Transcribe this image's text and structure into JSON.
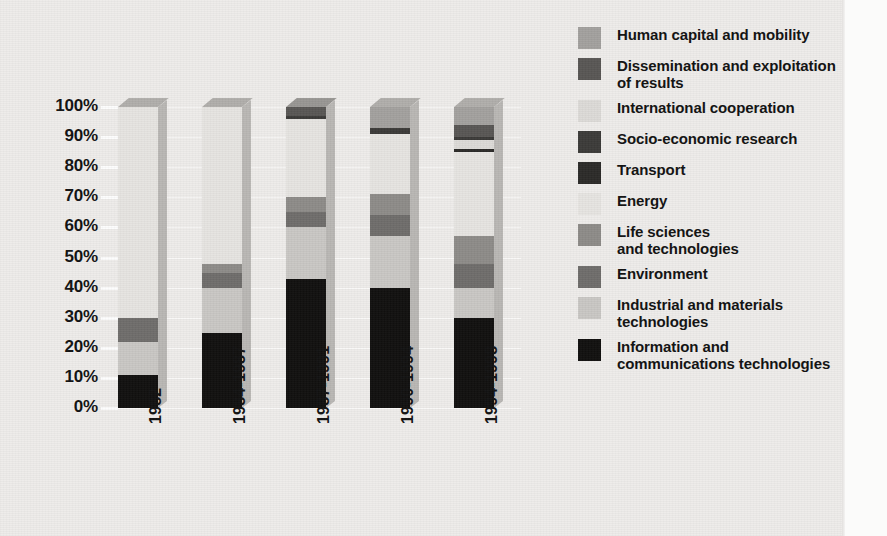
{
  "chart_data": {
    "type": "bar",
    "subtype": "stacked-percentage-column-3d",
    "title": "",
    "subtitle": "",
    "xlabel": "",
    "ylabel": "",
    "categories": [
      "1982",
      "1984-1987",
      "1987-1991",
      "1990-1994",
      "1994-1998"
    ],
    "ylim": [
      0,
      100
    ],
    "ytick_labels": [
      "100%",
      "90%",
      "80%",
      "70%",
      "60%",
      "50%",
      "40%",
      "30%",
      "20%",
      "10%",
      "0%"
    ],
    "ytick_values": [
      100,
      90,
      80,
      70,
      60,
      50,
      40,
      30,
      20,
      10,
      0
    ],
    "grid": true,
    "legend_position": "right",
    "units": "percent of total budget",
    "series": [
      {
        "name": "Information and communications technologies",
        "color": "#100f0e",
        "values": [
          11,
          25,
          43,
          40,
          30
        ]
      },
      {
        "name": "Industrial and materials technologies",
        "color": "#c9c7c4",
        "values": [
          11,
          15,
          17,
          17,
          10
        ]
      },
      {
        "name": "Environment",
        "color": "#6f6d6b",
        "values": [
          8,
          5,
          5,
          7,
          8
        ]
      },
      {
        "name": "Life sciences and technologies",
        "color": "#8d8b88",
        "values": [
          0,
          3,
          5,
          7,
          9
        ]
      },
      {
        "name": "Energy",
        "color": "#e3e1de",
        "values": [
          70,
          52,
          27,
          21,
          28
        ]
      },
      {
        "name": "Transport",
        "color": "#2b2a28",
        "values": [
          0,
          0,
          0,
          0,
          1
        ]
      },
      {
        "name": "Socio-economic research",
        "color": "#3b3a38",
        "values": [
          0,
          0,
          1,
          1,
          1
        ]
      },
      {
        "name": "International cooperation",
        "color": "#dcdad7",
        "values": [
          0,
          0,
          0,
          0,
          3
        ]
      },
      {
        "name": "Dissemination and exploitation of results",
        "color": "#585654",
        "values": [
          0,
          0,
          2,
          0,
          4
        ]
      },
      {
        "name": "Human capital and mobility",
        "color": "#a3a19e",
        "values": [
          0,
          0,
          0,
          7,
          6
        ]
      }
    ],
    "stacks": [
      {
        "category": "1982",
        "segments": [
          {
            "name": "Information and communications technologies",
            "from": 0,
            "to": 11,
            "color": "#100f0e"
          },
          {
            "name": "Industrial and materials technologies",
            "from": 11,
            "to": 22,
            "color": "#c9c7c4"
          },
          {
            "name": "Environment",
            "from": 22,
            "to": 30,
            "color": "#6f6d6b"
          },
          {
            "name": "Energy",
            "from": 30,
            "to": 100,
            "color": "#e6e4e1"
          }
        ],
        "cap_color": "#a3a19e"
      },
      {
        "category": "1984-1987",
        "segments": [
          {
            "name": "Information and communications technologies",
            "from": 0,
            "to": 25,
            "color": "#100f0e"
          },
          {
            "name": "Industrial and materials technologies",
            "from": 25,
            "to": 40,
            "color": "#c9c7c4"
          },
          {
            "name": "Environment",
            "from": 40,
            "to": 45,
            "color": "#6f6d6b"
          },
          {
            "name": "Life sciences and technologies",
            "from": 45,
            "to": 48,
            "color": "#8d8b88"
          },
          {
            "name": "Energy",
            "from": 48,
            "to": 100,
            "color": "#e6e4e1"
          }
        ],
        "cap_color": "#a3a19e"
      },
      {
        "category": "1987-1991",
        "segments": [
          {
            "name": "Information and communications technologies",
            "from": 0,
            "to": 43,
            "color": "#100f0e"
          },
          {
            "name": "Industrial and materials technologies",
            "from": 43,
            "to": 60,
            "color": "#c9c7c4"
          },
          {
            "name": "Environment",
            "from": 60,
            "to": 65,
            "color": "#6f6d6b"
          },
          {
            "name": "Life sciences and technologies",
            "from": 65,
            "to": 70,
            "color": "#8d8b88"
          },
          {
            "name": "Energy",
            "from": 70,
            "to": 96,
            "color": "#e6e4e1"
          },
          {
            "name": "Socio-economic research",
            "from": 96,
            "to": 97,
            "color": "#3b3a38"
          },
          {
            "name": "Dissemination and exploitation of results",
            "from": 97,
            "to": 100,
            "color": "#585654"
          }
        ],
        "cap_color": "#8d8b88"
      },
      {
        "category": "1990-1994",
        "segments": [
          {
            "name": "Information and communications technologies",
            "from": 0,
            "to": 40,
            "color": "#100f0e"
          },
          {
            "name": "Industrial and materials technologies",
            "from": 40,
            "to": 57,
            "color": "#c9c7c4"
          },
          {
            "name": "Environment",
            "from": 57,
            "to": 64,
            "color": "#6f6d6b"
          },
          {
            "name": "Life sciences and technologies",
            "from": 64,
            "to": 71,
            "color": "#8d8b88"
          },
          {
            "name": "Energy",
            "from": 71,
            "to": 91,
            "color": "#e6e4e1"
          },
          {
            "name": "Socio-economic research",
            "from": 91,
            "to": 93,
            "color": "#3b3a38"
          },
          {
            "name": "Human capital and mobility",
            "from": 93,
            "to": 100,
            "color": "#a3a19e"
          }
        ],
        "cap_color": "#a3a19e"
      },
      {
        "category": "1994-1998",
        "segments": [
          {
            "name": "Information and communications technologies",
            "from": 0,
            "to": 30,
            "color": "#100f0e"
          },
          {
            "name": "Industrial and materials technologies",
            "from": 30,
            "to": 40,
            "color": "#c9c7c4"
          },
          {
            "name": "Environment",
            "from": 40,
            "to": 48,
            "color": "#6f6d6b"
          },
          {
            "name": "Life sciences and technologies",
            "from": 48,
            "to": 57,
            "color": "#8d8b88"
          },
          {
            "name": "Energy",
            "from": 57,
            "to": 85,
            "color": "#e6e4e1"
          },
          {
            "name": "Transport",
            "from": 85,
            "to": 86,
            "color": "#2b2a28"
          },
          {
            "name": "International cooperation",
            "from": 86,
            "to": 89,
            "color": "#dcdad7"
          },
          {
            "name": "Socio-economic research",
            "from": 89,
            "to": 90,
            "color": "#3b3a38"
          },
          {
            "name": "Dissemination and exploitation of results",
            "from": 90,
            "to": 94,
            "color": "#585654"
          },
          {
            "name": "Human capital and mobility",
            "from": 94,
            "to": 100,
            "color": "#a3a19e"
          }
        ],
        "cap_color": "#a3a19e"
      }
    ],
    "legend": [
      {
        "label": "Human capital and mobility",
        "color": "#a3a19e"
      },
      {
        "label": "Dissemination and exploitation\nof results",
        "color": "#585654"
      },
      {
        "label": "International cooperation",
        "color": "#dcdad7"
      },
      {
        "label": "Socio-economic research",
        "color": "#3b3a38"
      },
      {
        "label": "Transport",
        "color": "#2b2a28"
      },
      {
        "label": "Energy",
        "color": "#e6e4e1"
      },
      {
        "label": "Life sciences\nand technologies",
        "color": "#8d8b88"
      },
      {
        "label": "Environment",
        "color": "#6f6d6b"
      },
      {
        "label": "Industrial and materials\ntechnologies",
        "color": "#c9c7c4"
      },
      {
        "label": "Information and\ncommunications technologies",
        "color": "#100f0e"
      }
    ]
  }
}
